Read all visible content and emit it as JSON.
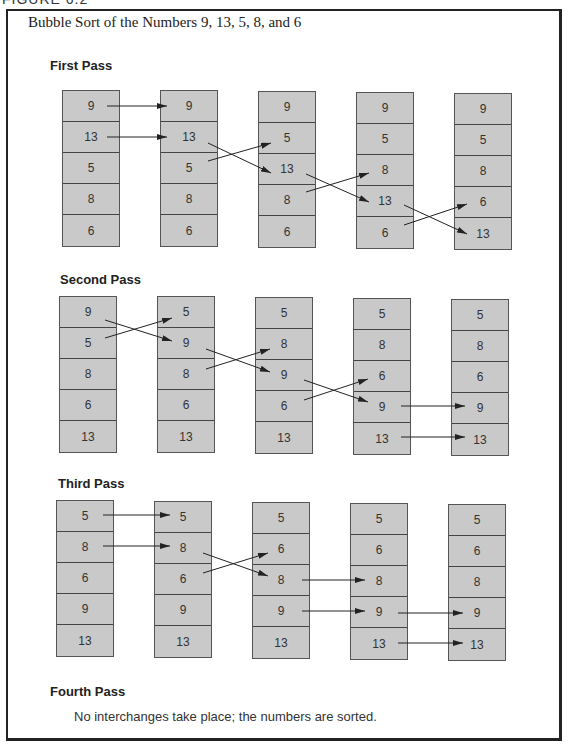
{
  "figure_label": "FIGURE 6.2",
  "title": "Bubble Sort of the Numbers 9, 13, 5, 8, and 6",
  "colors": {
    "cell_fill": "#c9c9c9",
    "border": "#444444",
    "arrow": "#222222"
  },
  "passes": [
    {
      "label": "First Pass",
      "columns": [
        [
          "9",
          "13",
          "5",
          "8",
          "6"
        ],
        [
          "9",
          "13",
          "5",
          "8",
          "6"
        ],
        [
          "9",
          "5",
          "13",
          "8",
          "6"
        ],
        [
          "9",
          "5",
          "8",
          "13",
          "6"
        ],
        [
          "9",
          "5",
          "8",
          "6",
          "13"
        ]
      ]
    },
    {
      "label": "Second Pass",
      "columns": [
        [
          "9",
          "5",
          "8",
          "6",
          "13"
        ],
        [
          "5",
          "9",
          "8",
          "6",
          "13"
        ],
        [
          "5",
          "8",
          "9",
          "6",
          "13"
        ],
        [
          "5",
          "8",
          "6",
          "9",
          "13"
        ],
        [
          "5",
          "8",
          "6",
          "9",
          "13"
        ]
      ]
    },
    {
      "label": "Third Pass",
      "columns": [
        [
          "5",
          "8",
          "6",
          "9",
          "13"
        ],
        [
          "5",
          "8",
          "6",
          "9",
          "13"
        ],
        [
          "5",
          "6",
          "8",
          "9",
          "13"
        ],
        [
          "5",
          "6",
          "8",
          "9",
          "13"
        ],
        [
          "5",
          "6",
          "8",
          "9",
          "13"
        ]
      ]
    }
  ],
  "fourth_pass": {
    "label": "Fourth Pass",
    "note": "No interchanges take place; the numbers are sorted."
  }
}
